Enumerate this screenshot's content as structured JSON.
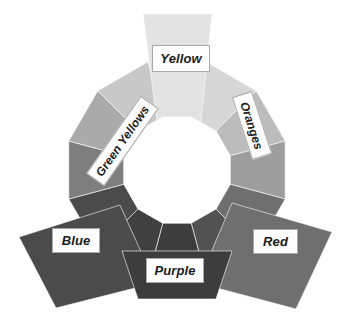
{
  "figure": {
    "name": "color-wheel-diagram",
    "background": "#ffffff",
    "center": {
      "x": 177,
      "y": 170
    },
    "hole_radius": 55,
    "ring_outer_radius": 112,
    "segment_count": 12
  },
  "chart_data": {
    "type": "pie",
    "title": "",
    "subtitle": "",
    "xlabel": "",
    "ylabel": "",
    "legend_position": "none",
    "grid": false,
    "categories": [
      "Yellow",
      "Orange Yellow",
      "Oranges",
      "Red Orange",
      "Red",
      "Red Purple",
      "Purple",
      "Blue Purple",
      "Blue",
      "Blue Green",
      "Green",
      "Green Yellows"
    ],
    "values": [
      30,
      30,
      30,
      30,
      30,
      30,
      30,
      30,
      30,
      30,
      30,
      30
    ],
    "slice_colors": [
      "#e2e2e2",
      "#d4d4d4",
      "#b9b9b9",
      "#9a9a9a",
      "#6d6d6d",
      "#515151",
      "#3c3c3c",
      "#3f3f3f",
      "#4a4a4a",
      "#7d7d7d",
      "#a9a9a9",
      "#c6c6c6"
    ],
    "annotations": [
      "Yellow",
      "Green Yellows",
      "Oranges",
      "Blue",
      "Red",
      "Purple"
    ]
  },
  "segments": [
    {
      "id": "yellow",
      "label": "Yellow",
      "color": "#e3e3e3",
      "start_angle": -105,
      "end_angle": -75
    },
    {
      "id": "orange-yellow",
      "label": "",
      "color": "#d6d6d6",
      "start_angle": -75,
      "end_angle": -45
    },
    {
      "id": "oranges",
      "label": "Oranges",
      "color": "#bcbcbc",
      "start_angle": -45,
      "end_angle": -15
    },
    {
      "id": "red-orange",
      "label": "",
      "color": "#9d9d9d",
      "start_angle": -15,
      "end_angle": 15
    },
    {
      "id": "red",
      "label": "Red",
      "color": "#6f6f6f",
      "start_angle": 15,
      "end_angle": 45
    },
    {
      "id": "red-purple",
      "label": "",
      "color": "#525252",
      "start_angle": 45,
      "end_angle": 75
    },
    {
      "id": "purple",
      "label": "Purple",
      "color": "#3d3d3d",
      "start_angle": 75,
      "end_angle": 105
    },
    {
      "id": "blue-purple",
      "label": "",
      "color": "#404040",
      "start_angle": 105,
      "end_angle": 135
    },
    {
      "id": "blue",
      "label": "Blue",
      "color": "#4b4b4b",
      "start_angle": 135,
      "end_angle": 165
    },
    {
      "id": "blue-green",
      "label": "",
      "color": "#7e7e7e",
      "start_angle": 165,
      "end_angle": 195
    },
    {
      "id": "green",
      "label": "",
      "color": "#aaaaaa",
      "start_angle": 195,
      "end_angle": 225
    },
    {
      "id": "green-yellows",
      "label": "Green Yellows",
      "color": "#c8c8c8",
      "start_angle": 225,
      "end_angle": 255
    }
  ],
  "labels": {
    "yellow": {
      "text": "Yellow",
      "rotation": 0,
      "x": 152,
      "y": 45,
      "w": 58,
      "h": 27,
      "font_size": 13
    },
    "green_yellows": {
      "text": "Green Yellows",
      "rotation": -55,
      "x": 75,
      "y": 130,
      "w": 95,
      "h": 22,
      "font_size": 12
    },
    "oranges": {
      "text": "Oranges",
      "rotation": 72,
      "x": 219,
      "y": 115,
      "w": 66,
      "h": 21,
      "font_size": 12
    },
    "blue": {
      "text": "Blue",
      "rotation": 0,
      "x": 52,
      "y": 228,
      "w": 48,
      "h": 25,
      "font_size": 13
    },
    "red": {
      "text": "Red",
      "rotation": 0,
      "x": 253,
      "y": 229,
      "w": 45,
      "h": 25,
      "font_size": 13
    },
    "purple": {
      "text": "Purple",
      "rotation": 0,
      "x": 146,
      "y": 258,
      "w": 58,
      "h": 25,
      "font_size": 13
    }
  },
  "colors": {
    "background": "#ffffff",
    "hole": "#ffffff",
    "label_box_fill": "#fdfdfd",
    "label_box_border": "#a8a8a8",
    "label_text": "#1b1b1b",
    "segment_divider": "#ffffff",
    "yellow_wedge": "#e3e3e3",
    "blue_wing": "#4b4b4b",
    "red_wing": "#6f6f6f",
    "purple_wedge": "#3d3d3d"
  },
  "wings": {
    "yellow_wedge_points": "143,14 212,14 200,130 158,130",
    "blue_wing_points": "19,237 120,205 155,283 56,308",
    "red_wing_points": "332,232 232,203 198,283 296,309",
    "purple_wedge_points": "122,251 232,251 216,299 138,299"
  }
}
